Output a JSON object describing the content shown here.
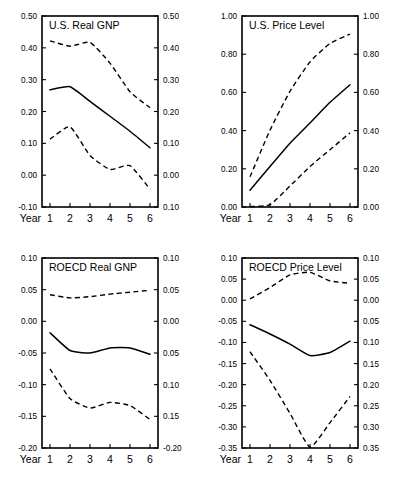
{
  "figure": {
    "title": "",
    "panel_count": 4,
    "x_axis_name": "Year",
    "colors": {
      "ink": "#000000",
      "background": "#ffffff"
    }
  },
  "chart_data": [
    {
      "id": "us-real-gnp",
      "type": "line",
      "title": "U.S. Real GNP",
      "xlabel": "Year",
      "ylabel": "",
      "x": [
        1,
        2,
        3,
        4,
        5,
        6
      ],
      "xlim": [
        0.6,
        6.4
      ],
      "ylim": [
        -0.1,
        0.5
      ],
      "yticks": [
        -0.1,
        0.0,
        0.1,
        0.2,
        0.3,
        0.4,
        0.5
      ],
      "ytick_labels": [
        "-0.10",
        "0.00",
        "0.10",
        "0.20",
        "0.30",
        "0.40",
        "0.50"
      ],
      "ytick_labels_right": [
        "0.10",
        "0.00",
        "0.10",
        "0.20",
        "0.30",
        "0.40",
        "0.50"
      ],
      "xtick_labels": [
        "1",
        "2",
        "3",
        "4",
        "5",
        "6"
      ],
      "grid": false,
      "legend": "none",
      "dual_axis": true,
      "series": [
        {
          "name": "upper band",
          "style": "dashed",
          "values": [
            0.422,
            0.405,
            0.417,
            0.352,
            0.262,
            0.212
          ]
        },
        {
          "name": "point estimate",
          "style": "solid",
          "values": [
            0.268,
            0.278,
            0.232,
            0.185,
            0.138,
            0.086
          ]
        },
        {
          "name": "lower band",
          "style": "dashed",
          "values": [
            0.113,
            0.152,
            0.062,
            0.018,
            0.03,
            -0.044
          ]
        }
      ]
    },
    {
      "id": "us-price-level",
      "type": "line",
      "title": "U.S. Price Level",
      "xlabel": "Year",
      "ylabel": "",
      "x": [
        1,
        2,
        3,
        4,
        5,
        6
      ],
      "xlim": [
        0.6,
        6.4
      ],
      "ylim": [
        0.0,
        1.0
      ],
      "yticks": [
        0.0,
        0.2,
        0.4,
        0.6,
        0.8,
        1.0
      ],
      "ytick_labels": [
        "0.00",
        "0.20",
        "0.40",
        "0.60",
        "0.80",
        "1.00"
      ],
      "ytick_labels_right": [
        "0.00",
        "0.20",
        "0.40",
        "0.60",
        "0.80",
        "1.00"
      ],
      "xtick_labels": [
        "1",
        "2",
        "3",
        "4",
        "5",
        "6"
      ],
      "grid": false,
      "legend": "none",
      "dual_axis": true,
      "series": [
        {
          "name": "upper band",
          "style": "dashed",
          "values": [
            0.158,
            0.402,
            0.606,
            0.76,
            0.856,
            0.905
          ]
        },
        {
          "name": "point estimate",
          "style": "solid",
          "values": [
            0.088,
            0.212,
            0.334,
            0.44,
            0.548,
            0.64
          ]
        },
        {
          "name": "lower band",
          "style": "dashed",
          "values": [
            0.002,
            0.012,
            0.11,
            0.212,
            0.3,
            0.388
          ]
        }
      ]
    },
    {
      "id": "roecd-real-gnp",
      "type": "line",
      "title": "ROECD Real GNP",
      "xlabel": "Year",
      "ylabel": "",
      "x": [
        1,
        2,
        3,
        4,
        5,
        6
      ],
      "xlim": [
        0.6,
        6.4
      ],
      "ylim": [
        -0.2,
        0.1
      ],
      "yticks": [
        -0.2,
        -0.15,
        -0.1,
        -0.05,
        0.0,
        0.05,
        0.1
      ],
      "ytick_labels": [
        "-0.20",
        "-0.15",
        "-0.10",
        "-0.05",
        "0.00",
        "0.05",
        "0.10"
      ],
      "ytick_labels_right": [
        "-0.20",
        "0.15",
        "0.10",
        "0.05",
        "0.00",
        "0.05",
        "0.10"
      ],
      "xtick_labels": [
        "1",
        "2",
        "3",
        "4",
        "5",
        "6"
      ],
      "grid": false,
      "legend": "none",
      "dual_axis": true,
      "series": [
        {
          "name": "upper band",
          "style": "dashed",
          "values": [
            0.042,
            0.037,
            0.039,
            0.043,
            0.046,
            0.049
          ]
        },
        {
          "name": "point estimate",
          "style": "solid",
          "values": [
            -0.018,
            -0.046,
            -0.05,
            -0.042,
            -0.042,
            -0.052
          ]
        },
        {
          "name": "lower band",
          "style": "dashed",
          "values": [
            -0.075,
            -0.122,
            -0.137,
            -0.128,
            -0.133,
            -0.155
          ]
        }
      ]
    },
    {
      "id": "roecd-price-level",
      "type": "line",
      "title": "ROECD Price Level",
      "xlabel": "Year",
      "ylabel": "",
      "x": [
        1,
        2,
        3,
        4,
        5,
        6
      ],
      "xlim": [
        0.6,
        6.4
      ],
      "ylim": [
        -0.35,
        0.1
      ],
      "yticks": [
        -0.35,
        -0.3,
        -0.25,
        -0.2,
        -0.15,
        -0.1,
        -0.05,
        0.0,
        0.05,
        0.1
      ],
      "ytick_labels": [
        "-0.35",
        "-0.30",
        "-0.25",
        "-0.20",
        "-0.15",
        "-0.10",
        "-0.05",
        "0.00",
        "0.05",
        "0.10"
      ],
      "ytick_labels_right": [
        "0.35",
        "0.30",
        "0.25",
        "0.20",
        "0.15",
        "0.10",
        "0.05",
        "0.00",
        "0.05",
        "0.10"
      ],
      "xtick_labels": [
        "1",
        "2",
        "3",
        "4",
        "5",
        "6"
      ],
      "grid": false,
      "legend": "none",
      "dual_axis": true,
      "series": [
        {
          "name": "upper band",
          "style": "dashed",
          "values": [
            0.003,
            0.03,
            0.06,
            0.066,
            0.046,
            0.04
          ]
        },
        {
          "name": "point estimate",
          "style": "solid",
          "values": [
            -0.058,
            -0.08,
            -0.104,
            -0.131,
            -0.124,
            -0.097
          ]
        },
        {
          "name": "lower band",
          "style": "dashed",
          "values": [
            -0.122,
            -0.19,
            -0.268,
            -0.348,
            -0.29,
            -0.228
          ]
        }
      ]
    }
  ]
}
